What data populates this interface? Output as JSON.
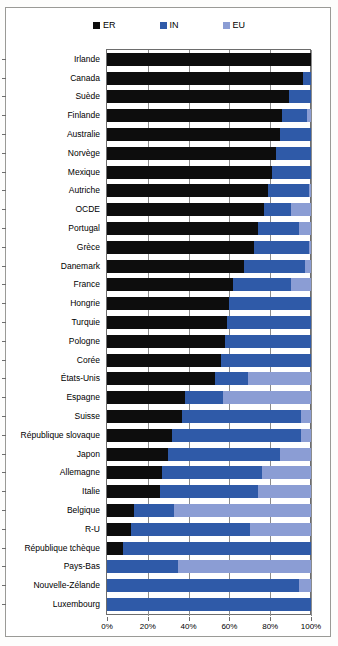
{
  "chart_data": {
    "type": "bar",
    "orientation": "horizontal",
    "stacked": true,
    "title": "",
    "subtitle": "",
    "xlabel": "",
    "ylabel": "",
    "xlim": [
      0,
      100
    ],
    "xticks": [
      "0%",
      "20%",
      "40%",
      "60%",
      "80%",
      "100%"
    ],
    "xtick_values": [
      0,
      20,
      40,
      60,
      80,
      100
    ],
    "grid": true,
    "legend_position": "top-center",
    "legend": [
      {
        "label": "ER",
        "color": "#0d0d0d"
      },
      {
        "label": "IN",
        "color": "#2f5aa8"
      },
      {
        "label": "EU",
        "color": "#8b9dd4"
      }
    ],
    "series": [
      {
        "name": "ER",
        "color": "#0d0d0d"
      },
      {
        "name": "IN",
        "color": "#2f5aa8"
      },
      {
        "name": "EU",
        "color": "#8b9dd4"
      }
    ],
    "categories": [
      "Irlande",
      "Canada",
      "Suède",
      "Finlande",
      "Australie",
      "Norvège",
      "Mexique",
      "Autriche",
      "OCDE",
      "Portugal",
      "Grèce",
      "Danemark",
      "France",
      "Hongrie",
      "Turquie",
      "Pologne",
      "Corée",
      "États-Unis",
      "Espagne",
      "Suisse",
      "République slovaque",
      "Japon",
      "Allemagne",
      "Italie",
      "Belgique",
      "R-U",
      "République tchèque",
      "Pays-Bas",
      "Nouvelle-Zélande",
      "Luxembourg"
    ],
    "rows": [
      {
        "category": "Irlande",
        "ER": 100,
        "IN": 0,
        "EU": 0
      },
      {
        "category": "Canada",
        "ER": 96,
        "IN": 4,
        "EU": 0
      },
      {
        "category": "Suède",
        "ER": 89,
        "IN": 11,
        "EU": 0
      },
      {
        "category": "Finlande",
        "ER": 86,
        "IN": 12,
        "EU": 2
      },
      {
        "category": "Australie",
        "ER": 85,
        "IN": 15,
        "EU": 0
      },
      {
        "category": "Norvège",
        "ER": 83,
        "IN": 17,
        "EU": 0
      },
      {
        "category": "Mexique",
        "ER": 81,
        "IN": 19,
        "EU": 0
      },
      {
        "category": "Autriche",
        "ER": 79,
        "IN": 20,
        "EU": 1
      },
      {
        "category": "OCDE",
        "ER": 77,
        "IN": 13,
        "EU": 10
      },
      {
        "category": "Portugal",
        "ER": 74,
        "IN": 20,
        "EU": 6
      },
      {
        "category": "Grèce",
        "ER": 72,
        "IN": 27,
        "EU": 1
      },
      {
        "category": "Danemark",
        "ER": 67,
        "IN": 30,
        "EU": 3
      },
      {
        "category": "France",
        "ER": 62,
        "IN": 28,
        "EU": 10
      },
      {
        "category": "Hongrie",
        "ER": 60,
        "IN": 40,
        "EU": 0
      },
      {
        "category": "Turquie",
        "ER": 59,
        "IN": 41,
        "EU": 0
      },
      {
        "category": "Pologne",
        "ER": 58,
        "IN": 42,
        "EU": 0
      },
      {
        "category": "Corée",
        "ER": 56,
        "IN": 44,
        "EU": 0
      },
      {
        "category": "États-Unis",
        "ER": 53,
        "IN": 16,
        "EU": 31
      },
      {
        "category": "Espagne",
        "ER": 38,
        "IN": 19,
        "EU": 43
      },
      {
        "category": "Suisse",
        "ER": 37,
        "IN": 58,
        "EU": 5
      },
      {
        "category": "République slovaque",
        "ER": 32,
        "IN": 63,
        "EU": 5
      },
      {
        "category": "Japon",
        "ER": 30,
        "IN": 55,
        "EU": 15
      },
      {
        "category": "Allemagne",
        "ER": 27,
        "IN": 49,
        "EU": 24
      },
      {
        "category": "Italie",
        "ER": 26,
        "IN": 48,
        "EU": 26
      },
      {
        "category": "Belgique",
        "ER": 13,
        "IN": 20,
        "EU": 67
      },
      {
        "category": "R-U",
        "ER": 12,
        "IN": 58,
        "EU": 30
      },
      {
        "category": "République tchèque",
        "ER": 8,
        "IN": 92,
        "EU": 0
      },
      {
        "category": "Pays-Bas",
        "ER": 0,
        "IN": 35,
        "EU": 65
      },
      {
        "category": "Nouvelle-Zélande",
        "ER": 0,
        "IN": 94,
        "EU": 6
      },
      {
        "category": "Luxembourg",
        "ER": 0,
        "IN": 100,
        "EU": 0
      }
    ]
  }
}
